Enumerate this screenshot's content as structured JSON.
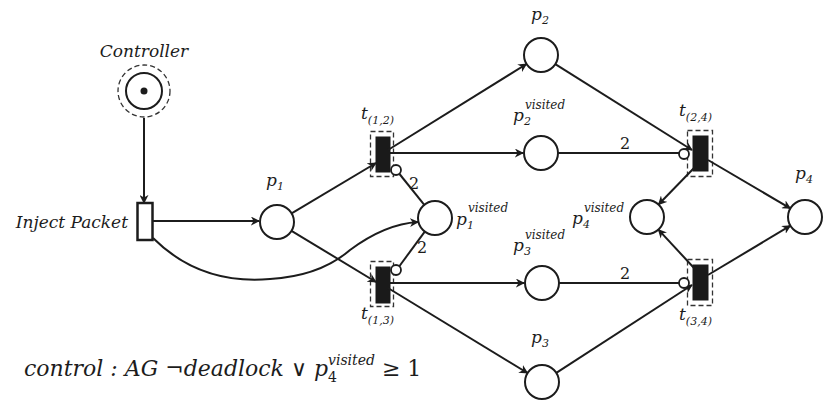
{
  "controller": {
    "label": "Controller",
    "tokens": 1
  },
  "inject": {
    "label": "Inject Packet"
  },
  "places": {
    "p1": {
      "base": "p",
      "sub": "1",
      "sup": ""
    },
    "p1v": {
      "base": "p",
      "sub": "1",
      "sup": "visited"
    },
    "p2": {
      "base": "p",
      "sub": "2",
      "sup": ""
    },
    "p2v": {
      "base": "p",
      "sub": "2",
      "sup": "visited"
    },
    "p3": {
      "base": "p",
      "sub": "3",
      "sup": ""
    },
    "p3v": {
      "base": "p",
      "sub": "3",
      "sup": "visited"
    },
    "p4": {
      "base": "p",
      "sub": "4",
      "sup": ""
    },
    "p4v": {
      "base": "p",
      "sub": "4",
      "sup": "visited"
    }
  },
  "transitions": {
    "t12": {
      "base": "t",
      "sub": "(1,2)"
    },
    "t13": {
      "base": "t",
      "sub": "(1,3)"
    },
    "t24": {
      "base": "t",
      "sub": "(2,4)"
    },
    "t34": {
      "base": "t",
      "sub": "(3,4)"
    }
  },
  "arc_weights": {
    "p1v_t12": "2",
    "p1v_t13": "2",
    "p2v_t24": "2",
    "p3v_t34": "2"
  },
  "formula": {
    "prefix": "control : AG ¬deadlock ∨ p",
    "sub": "4",
    "sup": "visited",
    "suffix": " ≥ 1"
  },
  "colors": {
    "ink": "#1c1c1c",
    "background": "#ffffff"
  }
}
